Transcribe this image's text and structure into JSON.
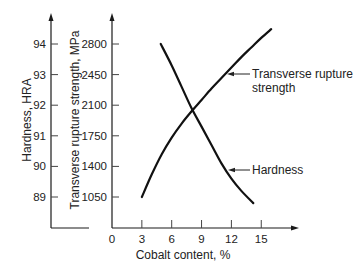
{
  "chart_data": {
    "type": "line",
    "title": "",
    "xlabel": "Cobalt content, %",
    "ylabel_left": "Hardness, HRA",
    "ylabel_right_inner": "Transverse rupture strength, MPa",
    "x_ticks": [
      0,
      3,
      6,
      9,
      12,
      15
    ],
    "x_range": [
      0,
      18
    ],
    "y_axes": [
      {
        "name": "Hardness, HRA",
        "ticks": [
          89,
          90,
          91,
          92,
          93,
          94
        ],
        "range": [
          88,
          95
        ]
      },
      {
        "name": "Transverse rupture strength, MPa",
        "ticks": [
          1050,
          1400,
          1750,
          2100,
          2450,
          2800
        ],
        "range": [
          700,
          3150
        ]
      }
    ],
    "grid": false,
    "legend": "inline annotations with leader arrows",
    "series": [
      {
        "name": "Transverse rupture strength",
        "axis": "Transverse rupture strength, MPa",
        "x": [
          3,
          4,
          5,
          6,
          7,
          8,
          9,
          10,
          11,
          12,
          13,
          14,
          15,
          16
        ],
        "values": [
          1050,
          1310,
          1540,
          1730,
          1890,
          2030,
          2160,
          2290,
          2410,
          2530,
          2650,
          2760,
          2870,
          2970
        ]
      },
      {
        "name": "Hardness",
        "axis": "Hardness, HRA",
        "x": [
          4.9,
          6,
          7,
          8,
          9,
          10,
          11,
          12,
          13,
          14.2
        ],
        "values": [
          94.0,
          93.3,
          92.6,
          91.9,
          91.3,
          90.7,
          90.1,
          89.6,
          89.2,
          88.8
        ]
      }
    ],
    "annotations": [
      {
        "text": [
          "Transverse rupture",
          "strength"
        ],
        "target": "Transverse rupture strength"
      },
      {
        "text": [
          "Hardness"
        ],
        "target": "Hardness"
      }
    ]
  },
  "labels": {
    "hardness_axis_title": "Hardness, HRA",
    "strength_axis_title": "Transverse rupture strength, MPa",
    "x_axis_title": "Cobalt content, %",
    "annotation_strength_line1": "Transverse rupture",
    "annotation_strength_line2": "strength",
    "annotation_hardness": "Hardness"
  }
}
